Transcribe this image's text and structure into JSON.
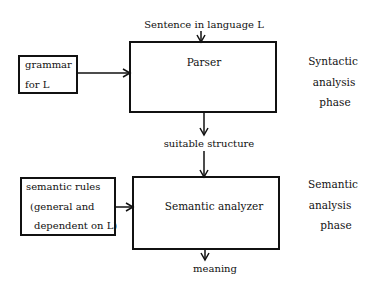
{
  "diagram": {
    "type": "flowchart",
    "colors": {
      "background": "#ffffff",
      "stroke": "#111111",
      "text": "#111111"
    },
    "input": {
      "label": "Sentence in language L"
    },
    "side_inputs": [
      {
        "id": "grammar",
        "lines": [
          "grammar",
          "for L"
        ]
      },
      {
        "id": "semantic-rules",
        "lines": [
          "semantic rules",
          "(general and",
          "dependent on L)"
        ]
      }
    ],
    "processes": [
      {
        "id": "parser",
        "label": "Parser"
      },
      {
        "id": "semantic-analyzer",
        "label": "Semantic analyzer"
      }
    ],
    "intermediate": {
      "label": "suitable structure"
    },
    "output": {
      "label": "meaning"
    },
    "phases": [
      {
        "id": "syntactic",
        "lines": [
          "Syntactic",
          "analysis",
          "phase"
        ]
      },
      {
        "id": "semantic",
        "lines": [
          "Semantic",
          "analysis",
          "phase"
        ]
      }
    ],
    "edges": [
      {
        "from": "input",
        "to": "parser"
      },
      {
        "from": "grammar",
        "to": "parser"
      },
      {
        "from": "parser",
        "to": "intermediate"
      },
      {
        "from": "intermediate",
        "to": "semantic-analyzer"
      },
      {
        "from": "semantic-rules",
        "to": "semantic-analyzer"
      },
      {
        "from": "semantic-analyzer",
        "to": "output"
      }
    ]
  }
}
